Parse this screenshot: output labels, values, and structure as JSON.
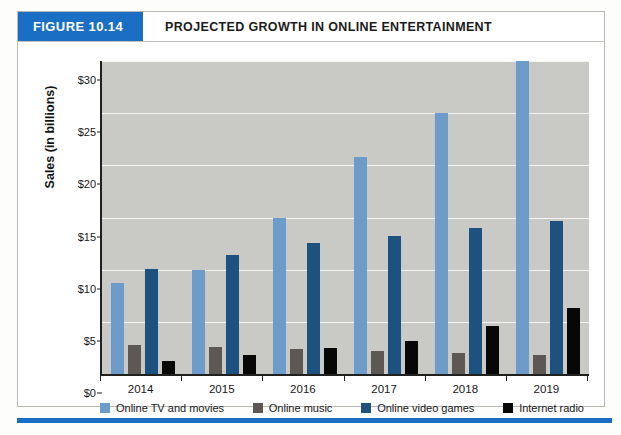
{
  "figure": {
    "badge": "FIGURE 10.14",
    "title": "PROJECTED GROWTH IN ONLINE ENTERTAINMENT",
    "badge_color": "#1a6fc4",
    "footer_rule_color": "#1a6fc4"
  },
  "chart_data": {
    "type": "bar",
    "title": "PROJECTED GROWTH IN ONLINE ENTERTAINMENT",
    "xlabel": "",
    "ylabel": "Sales (in billions)",
    "ylim": [
      0,
      30
    ],
    "ytick_values": [
      0,
      5,
      10,
      15,
      20,
      25,
      30
    ],
    "ytick_labels": [
      "$0",
      "$5",
      "$10",
      "$15",
      "$20",
      "$25",
      "$30"
    ],
    "grid": true,
    "legend_position": "bottom",
    "categories": [
      "2014",
      "2015",
      "2016",
      "2017",
      "2018",
      "2019"
    ],
    "series": [
      {
        "name": "Online TV and movies",
        "color": "#6d9ccb",
        "values": [
          8.7,
          10.0,
          15.0,
          20.8,
          25.0,
          30.0
        ]
      },
      {
        "name": "Online music",
        "color": "#5d5853",
        "values": [
          2.8,
          2.6,
          2.4,
          2.2,
          2.0,
          1.8
        ]
      },
      {
        "name": "Online video games",
        "color": "#1d5180",
        "values": [
          10.1,
          11.4,
          12.6,
          13.2,
          14.0,
          14.7
        ]
      },
      {
        "name": "Internet radio",
        "color": "#070707",
        "values": [
          1.2,
          1.8,
          2.5,
          3.2,
          4.6,
          6.3
        ]
      }
    ]
  }
}
